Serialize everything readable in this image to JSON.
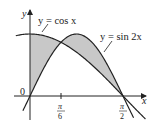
{
  "diagram": {
    "curves": [
      {
        "name": "cos",
        "label": "y = cos x"
      },
      {
        "name": "sin2x",
        "label": "y = sin 2x"
      }
    ],
    "axes": {
      "x_label": "x",
      "y_label": "y",
      "origin_label": "0"
    },
    "ticks": [
      {
        "num": "π",
        "den": "6",
        "value": 0.5236
      },
      {
        "num": "π",
        "den": "2",
        "value": 1.5708
      }
    ],
    "shade_color": "#c8c8c8",
    "line_color": "#222222"
  }
}
